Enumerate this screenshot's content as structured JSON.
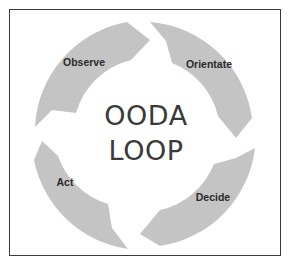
{
  "diagram": {
    "title_line1": "OODA",
    "title_line2": "LOOP",
    "segments": [
      {
        "label": "Observe",
        "position": "top-left"
      },
      {
        "label": "Orientate",
        "position": "top-right"
      },
      {
        "label": "Decide",
        "position": "bottom-right"
      },
      {
        "label": "Act",
        "position": "bottom-left"
      }
    ],
    "colors": {
      "arrow_fill": "#c4c4c4",
      "frame_border": "#3a3a3a",
      "title_text": "#3a3a3a",
      "label_text": "#2a2a2a",
      "background": "#ffffff"
    }
  }
}
